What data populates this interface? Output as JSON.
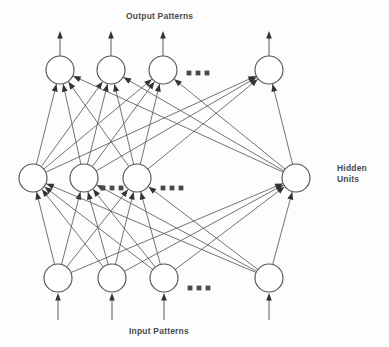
{
  "figure": {
    "title_output": "Output Patterns",
    "title_input": "Input Patterns",
    "title_hidden": "Hidden\nUnits",
    "colors": {
      "node_stroke": "#555555",
      "node_fill": "#ffffff",
      "connection": "#5a5a5a",
      "arrow": "#333333",
      "text": "#4a4a4a",
      "background": "#fdfdfd"
    }
  },
  "chart_data": {
    "type": "diagram",
    "subtype": "feedforward-neural-network",
    "layers": [
      {
        "name": "output",
        "label": "Output Patterns",
        "y": 70,
        "radius": 14,
        "node_x": [
          60,
          111,
          163,
          269
        ],
        "count_shown": 4,
        "ellipsis_after_index": 2,
        "ellipsis_x": [
          189,
          198,
          207
        ],
        "ellipsis_y": 73,
        "external_arrows": {
          "direction": "up",
          "from_y": 56,
          "to_y": 31
        }
      },
      {
        "name": "hidden",
        "label": "Hidden Units",
        "y": 178,
        "radius": 14,
        "node_x": [
          33,
          84,
          137,
          296
        ],
        "count_shown": 4,
        "ellipsis_groups": [
          {
            "x": [
              103,
              112,
              121
            ],
            "y": 188
          },
          {
            "x": [
              163,
              172,
              181
            ],
            "y": 188
          }
        ],
        "external_arrows": null
      },
      {
        "name": "input",
        "label": "Input Patterns",
        "y": 278,
        "radius": 14,
        "node_x": [
          58,
          112,
          164,
          269
        ],
        "count_shown": 4,
        "ellipsis_after_index": 2,
        "ellipsis_x": [
          190,
          199,
          208
        ],
        "ellipsis_y": 288,
        "external_arrows": {
          "direction": "up",
          "from_y": 320,
          "to_y": 293
        }
      }
    ],
    "connections": [
      {
        "from_layer": "input",
        "to_layer": "hidden",
        "pattern": "fully-connected",
        "arrowheads": true
      },
      {
        "from_layer": "hidden",
        "to_layer": "output",
        "pattern": "fully-connected",
        "arrowheads": true
      }
    ],
    "annotations": [
      "Output Patterns",
      "Hidden Units",
      "Input Patterns"
    ]
  }
}
